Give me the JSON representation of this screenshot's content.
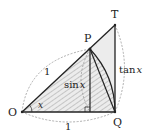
{
  "diagram": {
    "points": {
      "O": "O",
      "P": "P",
      "Q": "Q",
      "T": "T"
    },
    "labels": {
      "radius_OP": "1",
      "radius_OQ": "1",
      "angle": "x",
      "sin_func": "sin",
      "sin_var": "x",
      "tan_func": "tan",
      "tan_var": "x"
    },
    "colors": {
      "line": "#222222",
      "hatch": "#888888",
      "dashed": "#999999",
      "shade": "#e8e8e8"
    }
  }
}
